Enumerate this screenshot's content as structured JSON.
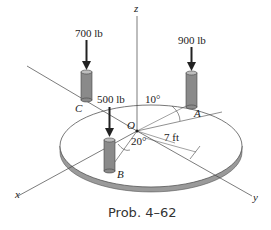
{
  "diagram": {
    "caption": "Prob. 4–62",
    "axes": {
      "x": "x",
      "y": "y",
      "z": "z"
    },
    "origin_label": "O",
    "forces": [
      {
        "point": "C",
        "magnitude": "700 lb"
      },
      {
        "point": "B",
        "magnitude": "500 lb"
      },
      {
        "point": "A",
        "magnitude": "900 lb"
      }
    ],
    "angles": {
      "a1": "10°",
      "a2": "20°"
    },
    "radius": "7 ft",
    "colors": {
      "post": "#8a8a8a",
      "plate_edge": "#9a9a9a",
      "line": "#333333"
    }
  }
}
